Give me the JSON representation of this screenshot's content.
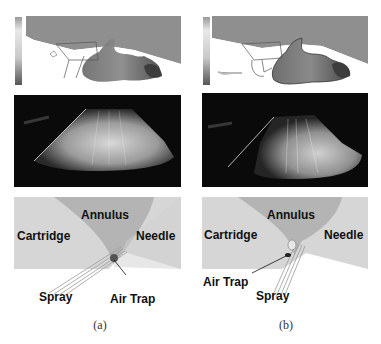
{
  "figure": {
    "panels": [
      {
        "id": "a",
        "caption": "(a)",
        "schematic_labels": {
          "annulus": "Annulus",
          "cartridge": "Cartridge",
          "needle": "Needle",
          "spray": "Spray",
          "air_trap": "Air Trap"
        }
      },
      {
        "id": "b",
        "caption": "(b)",
        "schematic_labels": {
          "annulus": "Annulus",
          "cartridge": "Cartridge",
          "needle": "Needle",
          "spray": "Spray",
          "air_trap": "Air Trap"
        }
      }
    ],
    "rows": [
      "simulation-contour",
      "spray-photograph",
      "schematic"
    ],
    "colors": {
      "background": "#ffffff",
      "simulation_fill": "#8f8f8f",
      "photo_background": "#0a0a0a",
      "schematic_background": "#d6d6d6",
      "annulus": "#b4b4b4",
      "text": "#111111"
    }
  }
}
